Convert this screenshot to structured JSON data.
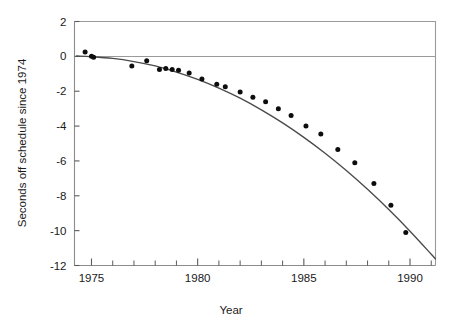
{
  "chart_data": {
    "type": "scatter",
    "title": "",
    "subtitle": "",
    "xlabel": "Year",
    "ylabel": "Seconds off schedule since 1974",
    "xlim": [
      1974.2,
      1991.2
    ],
    "ylim": [
      -12,
      2
    ],
    "x_ticks_major": [
      1975,
      1980,
      1985,
      1990
    ],
    "x_tick_labels": [
      "1975",
      "1980",
      "1985",
      "1990"
    ],
    "x_ticks_minor": [
      1974,
      1976,
      1977,
      1978,
      1979,
      1981,
      1982,
      1983,
      1984,
      1986,
      1987,
      1988,
      1989,
      1991
    ],
    "y_ticks": [
      2,
      0,
      -2,
      -4,
      -6,
      -8,
      -10,
      -12
    ],
    "y_tick_labels": [
      "2",
      "0",
      "-2",
      "-4",
      "-6",
      "-8",
      "-10",
      "-12"
    ],
    "grid": false,
    "legend": null,
    "zero_reference_line": 0,
    "series": [
      {
        "name": "Observations",
        "marker": "filled-circle",
        "color": "#0d0d0d",
        "x": [
          1974.7,
          1975.0,
          1975.1,
          1976.9,
          1977.6,
          1978.2,
          1978.5,
          1978.8,
          1979.1,
          1979.6,
          1980.2,
          1980.9,
          1981.3,
          1982.0,
          1982.6,
          1983.2,
          1983.8,
          1984.4,
          1985.1,
          1985.8,
          1986.6,
          1987.4,
          1988.3,
          1989.1,
          1989.8
        ],
        "y": [
          0.25,
          0.0,
          -0.05,
          -0.55,
          -0.25,
          -0.75,
          -0.7,
          -0.75,
          -0.8,
          -0.95,
          -1.3,
          -1.6,
          -1.75,
          -2.05,
          -2.35,
          -2.6,
          -3.0,
          -3.4,
          -4.0,
          -4.45,
          -5.35,
          -6.1,
          -7.3,
          -8.55,
          -10.1
        ]
      },
      {
        "name": "Fitted quadratic curve",
        "type": "line",
        "color": "#4a4a4a",
        "x": [
          1974.3,
          1975.0,
          1976.0,
          1977.0,
          1978.0,
          1979.0,
          1980.0,
          1981.0,
          1982.0,
          1983.0,
          1984.0,
          1985.0,
          1986.0,
          1987.0,
          1988.0,
          1989.0,
          1990.0,
          1991.0,
          1991.2
        ],
        "y": [
          0.02,
          -0.02,
          -0.12,
          -0.3,
          -0.55,
          -0.9,
          -1.32,
          -1.82,
          -2.4,
          -3.07,
          -3.82,
          -4.65,
          -5.56,
          -6.55,
          -7.63,
          -8.79,
          -10.03,
          -11.35,
          -11.62
        ]
      }
    ]
  },
  "axes": {
    "x_title": "Year",
    "y_title": "Seconds off schedule since 1974"
  }
}
